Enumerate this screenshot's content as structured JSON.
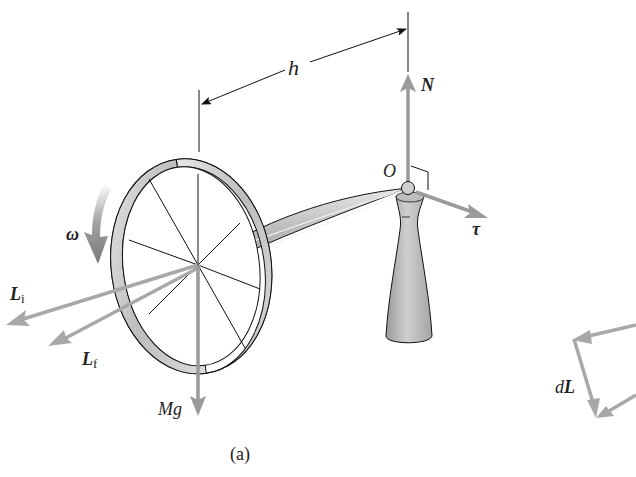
{
  "figure": {
    "caption": "(a)",
    "labels": {
      "h": "h",
      "N": "N",
      "O": "O",
      "tau": "τ",
      "omega": "ω",
      "L": "L",
      "L_i_sub": "i",
      "L_f_sub": "f",
      "Mg": "Mg",
      "dL_d": "d",
      "dL_L": "L"
    },
    "colors": {
      "vector_gray": "#9a9a9a",
      "outline": "#1a1a1a",
      "body_fill": "#c8c8c8",
      "background": "#ffffff"
    }
  }
}
